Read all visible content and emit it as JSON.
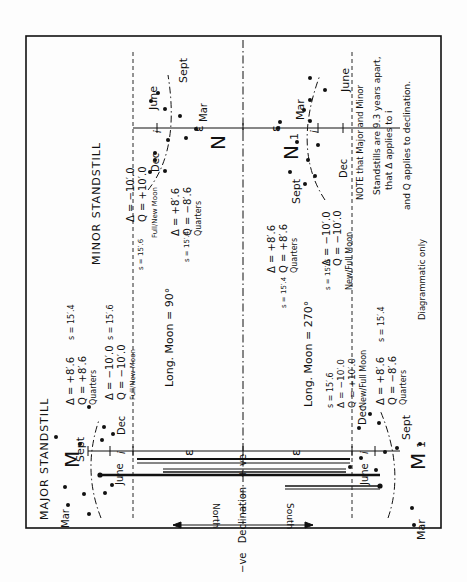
{
  "titles": {
    "major": "MAJOR STANDSTILL",
    "minor": "MINOR STANDSTILL"
  },
  "points": {
    "M": "M",
    "M1": "M",
    "M1_sub": "1",
    "N": "N",
    "N1": "N",
    "N1_sub": "1"
  },
  "months": {
    "mar": "Mar",
    "june": "June",
    "sept": "Sept",
    "dec": "Dec"
  },
  "symbols": {
    "epsilon": "ε",
    "inclination": "i"
  },
  "axis": {
    "neg": "−ve",
    "declination": "Declination",
    "pos": "+ ve",
    "north": "North",
    "south": "South"
  },
  "long_moon": {
    "at90": "Long. Moon = 90°",
    "at270": "Long. Moon = 270°"
  },
  "major_block": {
    "quarters_delta": "Δ = +8′.6",
    "quarters_q": "Q = +8′.6",
    "quarters_label": "Quarters",
    "quarters_s": "s = 15′.4",
    "fullnew_delta": "Δ = −10′.0",
    "fullnew_q": "Q = −10′.0",
    "fullnew_label": "Full/New Moon",
    "fullnew_s": "s = 15′.6"
  },
  "minor_block_90": {
    "fullnew_s": "s = 15′.6",
    "fullnew_delta": "Δ = −10′.0",
    "fullnew_q": "Q = +10′.0",
    "fullnew_label": "Full/New Moon",
    "quarters_s": "s = 15′.4",
    "quarters_delta": "Δ = +8′.6",
    "quarters_q": "Q = −8′.6",
    "quarters_label": "Quarters"
  },
  "major_block_270": {
    "newfull_s": "s = 15′.6",
    "newfull_delta": "Δ = −10′.0",
    "newfull_q": "Q = +10′.0",
    "newfull_label": "New/Full Moon",
    "quarters_delta": "Δ = +8′.6",
    "quarters_q": "Q = −8′.6",
    "quarters_label": "Quarters",
    "quarters_s": "s = 15′.4"
  },
  "minor_block_270": {
    "quarters_s": "s = 15′.4",
    "quarters_delta": "Δ = +8′.6",
    "quarters_q": "Q = +8′.6",
    "quarters_label": "Quarters",
    "newfull_s": "s = 15′.6",
    "newfull_delta": "Δ = −10′.0",
    "newfull_q": "Q = −10′.0",
    "newfull_label": "New/Full Moon"
  },
  "note": {
    "line1": "NOTE that Major and Minor",
    "line2": "Standstills are 9.3 years apart,",
    "line3": "that Δ applies to i",
    "line4": "and Q applies to declination.",
    "line5": "Diagrammatic only"
  },
  "colors": {
    "ink": "#111111",
    "paper": "#fdfdfd"
  }
}
